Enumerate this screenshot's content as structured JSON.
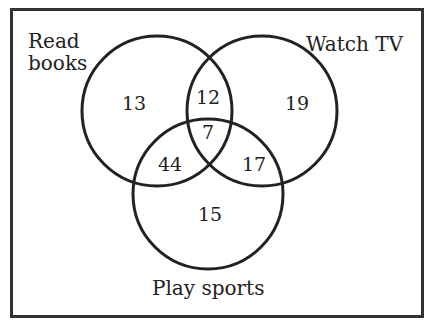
{
  "diagram": {
    "type": "venn-3",
    "sets": {
      "a": {
        "label_line1": "Read",
        "label_line2": "books"
      },
      "b": {
        "label": "Watch TV"
      },
      "c": {
        "label": "Play sports"
      }
    },
    "regions": {
      "a_only": "13",
      "b_only": "19",
      "c_only": "15",
      "ab_only": "12",
      "ac_only": "44",
      "bc_only": "17",
      "abc": "7"
    },
    "colors": {
      "stroke": "#222222",
      "background": "#ffffff"
    }
  }
}
